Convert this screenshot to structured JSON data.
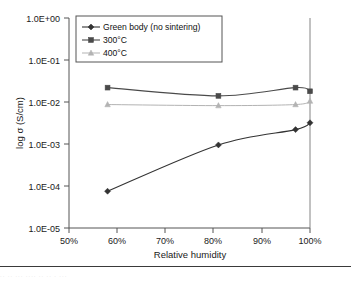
{
  "chart_data": {
    "type": "line",
    "title": "",
    "xlabel": "Relative humidity",
    "ylabel": "log σ (S/cm)",
    "x": [
      58,
      81,
      97,
      100
    ],
    "xlim": [
      50,
      100
    ],
    "ylim": [
      1e-05,
      1
    ],
    "yscale": "log",
    "grid": false,
    "legend_position": "top-left-inside",
    "xtick_labels": [
      "50%",
      "60%",
      "70%",
      "80%",
      "90%",
      "100%"
    ],
    "xtick_values": [
      50,
      60,
      70,
      80,
      90,
      100
    ],
    "ytick_labels": [
      "1.0E+00",
      "1.0E-01",
      "1.0E-02",
      "1.0E-03",
      "1.0E-04",
      "1.0E-05"
    ],
    "ytick_values": [
      1,
      0.1,
      0.01,
      0.001,
      0.0001,
      1e-05
    ],
    "series": [
      {
        "name": "Green body (no sintering)",
        "marker": "diamond",
        "color": "#333333",
        "values": [
          7.5e-05,
          0.00095,
          0.0022,
          0.0032
        ]
      },
      {
        "name": "300°C",
        "marker": "square",
        "color": "#4a4a4a",
        "values": [
          0.022,
          0.014,
          0.022,
          0.018
        ]
      },
      {
        "name": "400°C",
        "marker": "triangle",
        "color": "#b3b3b3",
        "values": [
          0.0087,
          0.0082,
          0.0087,
          0.0105
        ]
      }
    ]
  },
  "axes": {
    "x_title": "Relative humidity",
    "y_title": "log σ (S/cm)",
    "x_ticks": [
      "50%",
      "60%",
      "70%",
      "80%",
      "90%",
      "100%"
    ],
    "y_ticks": [
      "1.0E+00",
      "1.0E-01",
      "1.0E-02",
      "1.0E-03",
      "1.0E-04",
      "1.0E-05"
    ]
  },
  "legend": {
    "items": [
      {
        "label": "Green body (no sintering)",
        "marker": "diamond",
        "color": "#333333"
      },
      {
        "label": "300°C",
        "marker": "square",
        "color": "#4a4a4a"
      },
      {
        "label": "400°C",
        "marker": "triangle",
        "color": "#b3b3b3"
      }
    ]
  },
  "footer": {
    "smudge_text": "··  ··         ···  ····                              ··       ··            ·  ···"
  }
}
